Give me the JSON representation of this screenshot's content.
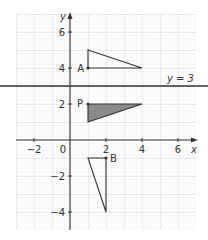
{
  "diagram": {
    "axes": {
      "x_label": "x",
      "y_label": "y",
      "x_ticks": [
        "−2",
        "0",
        "2",
        "4",
        "6"
      ],
      "y_ticks": [
        "6",
        "4",
        "2",
        "−2",
        "−4"
      ]
    },
    "line_label": "y = 3",
    "points": {
      "A": "A",
      "P": "P",
      "B": "B"
    },
    "colors": {
      "grid_minor": "#dcdcdc",
      "grid_major": "#c4c4c4",
      "axis": "#333333",
      "shaded": "#8a8a8a"
    }
  }
}
